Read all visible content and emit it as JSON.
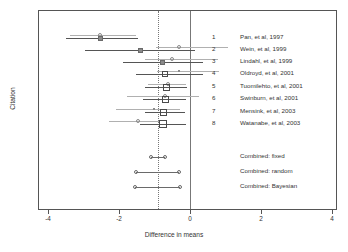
{
  "chart_data": {
    "type": "forest",
    "title": "",
    "xlabel": "Difference in means",
    "ylabel": "Citation",
    "xlim": [
      -4.4,
      4.4
    ],
    "xticks": [
      -4,
      -2,
      0,
      4
    ],
    "xtick_labels": [
      "-4",
      "-2",
      "0",
      "2",
      "4"
    ],
    "xticks_all": [
      -4,
      -2,
      0,
      2,
      4
    ],
    "grid": false,
    "null_line": 0,
    "pooled_reference_line": -0.93,
    "legend": "none",
    "categories": [
      "Pan, et al, 1997",
      "Wein, et al, 1999",
      "Lindahl, et al, 1999",
      "Oldroyd, et al, 2001",
      "Tuomilehto, et al, 2001",
      "Swinburn, et al, 2001",
      "Mensink, et al, 2003",
      "Watanabe, et al, 2003"
    ],
    "studies": [
      {
        "index": "1",
        "label": "Pan, et al, 1997",
        "estimate": -2.55,
        "ci_low": -3.52,
        "ci_high": -1.48,
        "weight": 0.3,
        "marker": "filled-square",
        "secondary": {
          "estimate": -2.55,
          "ci_low": -3.4,
          "ci_high": -1.55,
          "marker": "open-circle"
        }
      },
      {
        "index": "2",
        "label": "Wein, et al, 1999",
        "estimate": -1.42,
        "ci_low": -3.0,
        "ci_high": 0.12,
        "weight": 0.28,
        "marker": "filled-square",
        "secondary": {
          "estimate": -0.35,
          "ci_low": -1.0,
          "ci_high": 1.05,
          "marker": "open-circle"
        }
      },
      {
        "index": "3",
        "label": "Lindahl, et al, 1999",
        "estimate": -0.79,
        "ci_low": -1.92,
        "ci_high": 0.34,
        "weight": 0.34,
        "marker": "filled-square",
        "secondary": {
          "estimate": -0.53,
          "ci_low": -1.3,
          "ci_high": 0.75,
          "marker": "open-circle"
        }
      },
      {
        "index": "4",
        "label": "Oldroyd, et al, 2001",
        "estimate": -0.72,
        "ci_low": -1.55,
        "ci_high": 0.34,
        "weight": 0.42,
        "marker": "open-square",
        "secondary": {
          "estimate": -0.34,
          "ci_low": -0.95,
          "ci_high": 0.8,
          "marker": "small-dot"
        }
      },
      {
        "index": "5",
        "label": "Tuomilehto, et al, 2001",
        "estimate": -0.7,
        "ci_low": -1.3,
        "ci_high": -0.1,
        "weight": 0.52,
        "marker": "open-square",
        "secondary": {
          "estimate": -0.66,
          "ci_low": -1.2,
          "ci_high": -0.15,
          "marker": "open-circle"
        }
      },
      {
        "index": "6",
        "label": "Swinburn, et al, 2001",
        "estimate": -0.73,
        "ci_low": -1.35,
        "ci_high": -0.15,
        "weight": 0.64,
        "marker": "open-square",
        "secondary": {
          "estimate": -0.73,
          "ci_low": -1.8,
          "ci_high": 0.22,
          "marker": "open-circle"
        }
      },
      {
        "index": "7",
        "label": "Mensink, et al, 2003",
        "estimate": -0.77,
        "ci_low": -1.3,
        "ci_high": -0.16,
        "weight": 0.64,
        "marker": "open-square",
        "secondary": {
          "estimate": -1.05,
          "ci_low": -2.1,
          "ci_high": -0.3,
          "marker": "small-dot"
        }
      },
      {
        "index": "8",
        "label": "Watanabe, et al, 2003",
        "estimate": -0.8,
        "ci_low": -1.45,
        "ci_high": -0.13,
        "weight": 0.78,
        "marker": "open-square",
        "secondary": {
          "estimate": -1.48,
          "ci_low": -2.3,
          "ci_high": -0.9,
          "marker": "open-circle"
        }
      }
    ],
    "combined": [
      {
        "label": "Combined: fixed",
        "estimate": -0.93,
        "ci_low": -1.12,
        "ci_high": -0.72,
        "marker": "open-circle-ends"
      },
      {
        "label": "Combined: random",
        "estimate": -0.93,
        "ci_low": -1.55,
        "ci_high": -0.35,
        "marker": "open-circle-ends"
      },
      {
        "label": "Combined: Bayesian",
        "estimate": -0.93,
        "ci_low": -1.58,
        "ci_high": -0.32,
        "marker": "open-circle-ends"
      }
    ]
  },
  "axes": {
    "xlabel": "Difference in means",
    "ylabel": "Citation",
    "xtick_labels": [
      "-4",
      "-2",
      "0",
      "2",
      "4"
    ]
  },
  "colors": {
    "primary_line": "#555555",
    "secondary_line": "#b0b0b0",
    "frame": "#555555",
    "reference": "#777777",
    "text": "#333333"
  }
}
